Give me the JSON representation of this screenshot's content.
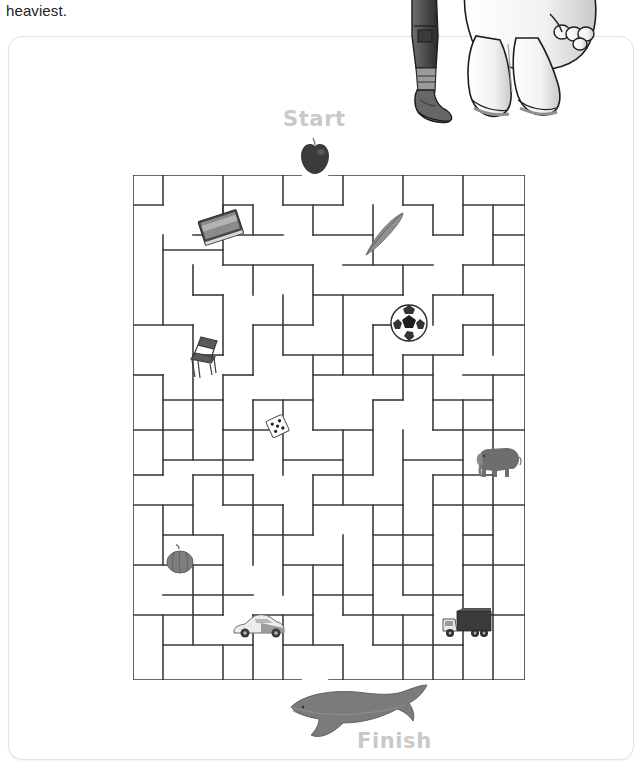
{
  "instruction": {
    "text": "heaviest."
  },
  "card": {
    "start_label": "Start",
    "finish_label": "Finish",
    "accent_label_color": "#c9c9c9",
    "maze_wall_color": "#3a3a3a",
    "border_color": "#e2e2e2",
    "background_color": "#ffffff"
  },
  "maze": {
    "columns": 13,
    "rows": 17,
    "cell_size": 30,
    "origin_x": 124,
    "origin_y": 138,
    "width": 392,
    "height": 505,
    "objects": [
      {
        "name": "apple",
        "label": "apple",
        "x": 288,
        "y": 100
      },
      {
        "name": "book",
        "label": "book",
        "x": 186,
        "y": 170
      },
      {
        "name": "feather",
        "label": "feather",
        "x": 352,
        "y": 172
      },
      {
        "name": "ball",
        "label": "soccer ball",
        "x": 380,
        "y": 266
      },
      {
        "name": "chair",
        "label": "chair",
        "x": 178,
        "y": 296
      },
      {
        "name": "dice",
        "label": "dice",
        "x": 255,
        "y": 374
      },
      {
        "name": "elephant",
        "label": "elephant",
        "x": 464,
        "y": 402
      },
      {
        "name": "pumpkin",
        "label": "pumpkin",
        "x": 155,
        "y": 506
      },
      {
        "name": "car",
        "label": "car",
        "x": 222,
        "y": 572
      },
      {
        "name": "truck",
        "label": "truck",
        "x": 432,
        "y": 570
      },
      {
        "name": "whale",
        "label": "whale",
        "x": 270,
        "y": 646
      }
    ]
  },
  "cartoon_overlay": {
    "label": "cartoon legs illustration"
  }
}
